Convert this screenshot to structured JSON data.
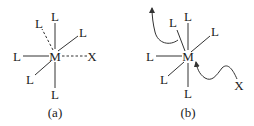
{
  "figure": {
    "panels": [
      {
        "id": "a",
        "caption": "(a)",
        "center_label": "M",
        "ligands": {
          "top": "L",
          "upper_left": "L",
          "upper_right": "L",
          "left": "L",
          "lower_left": "L",
          "bottom": "L"
        },
        "entering_group": "X",
        "dashed_bonds": [
          "upper_left",
          "right_to_X"
        ]
      },
      {
        "id": "b",
        "caption": "(b)",
        "center_label": "M",
        "ligands": {
          "top": "L",
          "upper_left": "L",
          "upper_right": "L",
          "left": "L",
          "lower_left": "L",
          "bottom": "L"
        },
        "entering_group": "X",
        "arrows": [
          "leaving ligand departs upward-left",
          "X approaches M from lower-right"
        ]
      }
    ],
    "colors": {
      "ink": "#333333",
      "background": "#ffffff"
    }
  }
}
